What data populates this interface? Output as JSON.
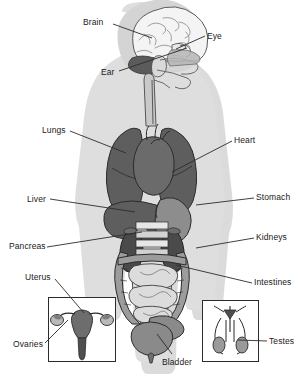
{
  "figure": {
    "background_color": "#ffffff",
    "body_silhouette_color": "#dcdcdc",
    "body_shadow_color": "#c9c9c9",
    "organ_dark_color": "#595959",
    "organ_mid_color": "#8f8f8f",
    "organ_light_color": "#c2c2c2",
    "outline_color": "#2b2b2b",
    "leader_line_color": "#2b2b2b",
    "label_text_color": "#1a1a1a"
  },
  "labels": [
    {
      "id": "brain",
      "text": "Brain",
      "x": 83,
      "y": 17,
      "align": "left"
    },
    {
      "id": "eye",
      "text": "Eye",
      "x": 207,
      "y": 31,
      "align": "left"
    },
    {
      "id": "ear",
      "text": "Ear",
      "x": 101,
      "y": 67,
      "align": "left"
    },
    {
      "id": "lungs",
      "text": "Lungs",
      "x": 42,
      "y": 125,
      "align": "left"
    },
    {
      "id": "heart",
      "text": "Heart",
      "x": 234,
      "y": 135,
      "align": "left"
    },
    {
      "id": "liver",
      "text": "Liver",
      "x": 27,
      "y": 194,
      "align": "left"
    },
    {
      "id": "stomach",
      "text": "Stomach",
      "x": 256,
      "y": 192,
      "align": "left"
    },
    {
      "id": "pancreas",
      "text": "Pancreas",
      "x": 9,
      "y": 241,
      "align": "left"
    },
    {
      "id": "kidneys",
      "text": "Kidneys",
      "x": 256,
      "y": 232,
      "align": "left"
    },
    {
      "id": "uterus",
      "text": "Uterus",
      "x": 25,
      "y": 272,
      "align": "left"
    },
    {
      "id": "intestines",
      "text": "Intestines",
      "x": 254,
      "y": 277,
      "align": "left"
    },
    {
      "id": "ovaries",
      "text": "Ovaries",
      "x": 13,
      "y": 339,
      "align": "left"
    },
    {
      "id": "testes",
      "text": "Testes",
      "x": 269,
      "y": 336,
      "align": "left"
    },
    {
      "id": "bladder",
      "text": "Bladder",
      "x": 162,
      "y": 357,
      "align": "left"
    }
  ],
  "leader_lines": [
    {
      "id": "brain",
      "x1": 113,
      "y1": 24,
      "x2": 152,
      "y2": 38
    },
    {
      "id": "eye",
      "x1": 205,
      "y1": 36,
      "x2": 176,
      "y2": 49
    },
    {
      "id": "ear",
      "x1": 119,
      "y1": 71,
      "x2": 187,
      "y2": 48
    },
    {
      "id": "lungs",
      "x1": 70,
      "y1": 131,
      "x2": 126,
      "y2": 153
    },
    {
      "id": "heart",
      "x1": 232,
      "y1": 141,
      "x2": 172,
      "y2": 172
    },
    {
      "id": "liver",
      "x1": 50,
      "y1": 199,
      "x2": 135,
      "y2": 212
    },
    {
      "id": "stomach",
      "x1": 254,
      "y1": 198,
      "x2": 196,
      "y2": 205
    },
    {
      "id": "pancreas",
      "x1": 47,
      "y1": 247,
      "x2": 142,
      "y2": 232
    },
    {
      "id": "kidneys",
      "x1": 254,
      "y1": 238,
      "x2": 196,
      "y2": 248
    },
    {
      "id": "uterus",
      "x1": 55,
      "y1": 279,
      "x2": 84,
      "y2": 313
    },
    {
      "id": "intestines",
      "x1": 252,
      "y1": 283,
      "x2": 176,
      "y2": 265
    },
    {
      "id": "ovaries",
      "x1": 45,
      "y1": 343,
      "x2": 68,
      "y2": 320
    },
    {
      "id": "testes",
      "x1": 267,
      "y1": 341,
      "x2": 238,
      "y2": 340
    },
    {
      "id": "bladder",
      "x1": 172,
      "y1": 354,
      "x2": 157,
      "y2": 334
    }
  ],
  "insets": [
    {
      "id": "female-reproductive",
      "x": 48,
      "y": 297,
      "width": 68,
      "height": 65
    },
    {
      "id": "male-reproductive",
      "x": 202,
      "y": 300,
      "width": 57,
      "height": 62
    }
  ]
}
